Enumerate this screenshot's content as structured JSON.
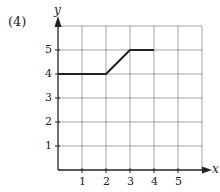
{
  "problem_label": "(4)",
  "chart_data": {
    "type": "line",
    "title": "",
    "xlabel": "x",
    "ylabel": "y",
    "x_ticks": [
      "1",
      "2",
      "3",
      "4",
      "5"
    ],
    "y_ticks": [
      "1",
      "2",
      "3",
      "4",
      "5"
    ],
    "xlim": [
      0,
      6
    ],
    "ylim": [
      0,
      6
    ],
    "grid": true,
    "series": [
      {
        "name": "graph",
        "x": [
          0,
          2,
          3,
          4
        ],
        "y": [
          4,
          4,
          5,
          5
        ]
      }
    ]
  }
}
